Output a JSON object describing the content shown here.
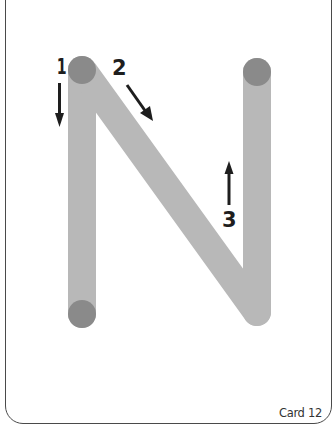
{
  "card": {
    "label": "Card 12",
    "border_color": "#4a4a4a"
  },
  "letter": {
    "character": "N",
    "stroke_color": "#b8b8b8",
    "endpoint_color": "#8a8a8a",
    "strokes": [
      {
        "order": 1,
        "label": "1",
        "direction": "down",
        "from": [
          82,
          70
        ],
        "to": [
          82,
          314
        ]
      },
      {
        "order": 2,
        "label": "2",
        "direction": "down-right",
        "from": [
          82,
          70
        ],
        "to": [
          257,
          312
        ]
      },
      {
        "order": 3,
        "label": "3",
        "direction": "up",
        "from": [
          257,
          312
        ],
        "to": [
          257,
          72
        ]
      }
    ],
    "endpoints": [
      {
        "name": "top-left",
        "x": 82,
        "y": 70
      },
      {
        "name": "bottom-left",
        "x": 82,
        "y": 314
      },
      {
        "name": "top-right",
        "x": 257,
        "y": 72
      }
    ]
  },
  "arrows": {
    "color": "#1e1e1e"
  }
}
